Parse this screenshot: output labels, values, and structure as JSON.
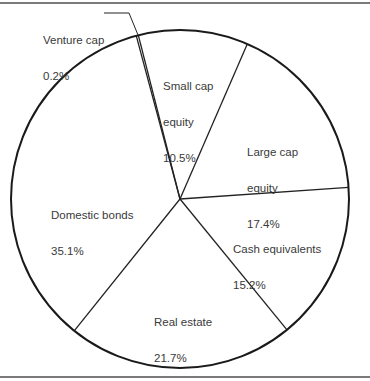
{
  "chart_data": {
    "type": "pie",
    "title": "",
    "start_angle_deg": -15,
    "direction": "clockwise",
    "slices": [
      {
        "label": "Venture cap",
        "value": 0.2,
        "display": "0.2%"
      },
      {
        "label": "Small cap equity",
        "value": 10.5,
        "display": "10.5%"
      },
      {
        "label": "Large cap equity",
        "value": 17.4,
        "display": "17.4%"
      },
      {
        "label": "Cash equivalents",
        "value": 15.2,
        "display": "15.2%"
      },
      {
        "label": "Real estate",
        "value": 21.7,
        "display": "21.7%"
      },
      {
        "label": "Domestic bonds",
        "value": 35.1,
        "display": "35.1%"
      }
    ],
    "legend": "none (direct labels)"
  },
  "labels": {
    "venture": {
      "name": "Venture cap",
      "pct": "0.2%"
    },
    "small": {
      "line1": "Small cap",
      "line2": "equity",
      "pct": "10.5%"
    },
    "large": {
      "line1": "Large cap",
      "line2": "equity",
      "pct": "17.4%"
    },
    "cash": {
      "name": "Cash equivalents",
      "pct": "15.2%"
    },
    "real": {
      "name": "Real estate",
      "pct": "21.7%"
    },
    "domestic": {
      "name": "Domestic bonds",
      "pct": "35.1%"
    }
  }
}
